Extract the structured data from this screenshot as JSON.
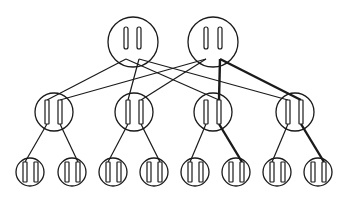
{
  "diagram": {
    "type": "hierarchical-tree",
    "colors": {
      "stroke": "#1a1a1a",
      "background": "#ffffff"
    },
    "levels": [
      {
        "name": "top",
        "radius": 25,
        "nodes": [
          {
            "id": "T1",
            "cx": 133,
            "cy": 42,
            "rods": [
              126,
              139
            ]
          },
          {
            "id": "T2",
            "cx": 213,
            "cy": 42,
            "rods": [
              206,
              220
            ]
          }
        ]
      },
      {
        "name": "middle",
        "radius": 19,
        "nodes": [
          {
            "id": "M1",
            "cx": 54,
            "cy": 112,
            "rods": [
              47,
              60
            ]
          },
          {
            "id": "M2",
            "cx": 134,
            "cy": 112,
            "rods": [
              128,
              141
            ]
          },
          {
            "id": "M3",
            "cx": 213,
            "cy": 112,
            "rods": [
              206,
              219
            ]
          },
          {
            "id": "M4",
            "cx": 295,
            "cy": 112,
            "rods": [
              288,
              301
            ]
          }
        ]
      },
      {
        "name": "bottom",
        "radius": 14,
        "nodes": [
          {
            "id": "B1",
            "cx": 30,
            "cy": 172,
            "rods": [
              25,
              36
            ]
          },
          {
            "id": "B2",
            "cx": 72,
            "cy": 172,
            "rods": [
              67,
              78
            ]
          },
          {
            "id": "B3",
            "cx": 113,
            "cy": 172,
            "rods": [
              108,
              119
            ]
          },
          {
            "id": "B4",
            "cx": 154,
            "cy": 172,
            "rods": [
              149,
              160
            ]
          },
          {
            "id": "B5",
            "cx": 195,
            "cy": 172,
            "rods": [
              190,
              201
            ]
          },
          {
            "id": "B6",
            "cx": 236,
            "cy": 172,
            "rods": [
              231,
              242
            ]
          },
          {
            "id": "B7",
            "cx": 277,
            "cy": 172,
            "rods": [
              272,
              283
            ]
          },
          {
            "id": "B8",
            "cx": 318,
            "cy": 172,
            "rods": [
              313,
              324
            ]
          }
        ]
      }
    ],
    "edges": [
      {
        "from": [
          126,
          59
        ],
        "to": [
          47,
          100
        ],
        "bold": false
      },
      {
        "from": [
          126,
          59
        ],
        "to": [
          219,
          100
        ],
        "bold": false
      },
      {
        "from": [
          139,
          59
        ],
        "to": [
          128,
          100
        ],
        "bold": false
      },
      {
        "from": [
          139,
          59
        ],
        "to": [
          288,
          100
        ],
        "bold": false
      },
      {
        "from": [
          206,
          59
        ],
        "to": [
          60,
          100
        ],
        "bold": false
      },
      {
        "from": [
          206,
          59
        ],
        "to": [
          141,
          100
        ],
        "bold": false
      },
      {
        "from": [
          220,
          59
        ],
        "to": [
          219,
          100
        ],
        "bold": true
      },
      {
        "from": [
          220,
          59
        ],
        "to": [
          301,
          100
        ],
        "bold": true
      },
      {
        "from": [
          47,
          124
        ],
        "to": [
          25,
          162
        ],
        "bold": false
      },
      {
        "from": [
          60,
          124
        ],
        "to": [
          78,
          162
        ],
        "bold": false
      },
      {
        "from": [
          128,
          124
        ],
        "to": [
          108,
          162
        ],
        "bold": false
      },
      {
        "from": [
          141,
          124
        ],
        "to": [
          160,
          162
        ],
        "bold": false
      },
      {
        "from": [
          206,
          124
        ],
        "to": [
          190,
          162
        ],
        "bold": false
      },
      {
        "from": [
          219,
          124
        ],
        "to": [
          242,
          162
        ],
        "bold": true
      },
      {
        "from": [
          288,
          124
        ],
        "to": [
          272,
          162
        ],
        "bold": false
      },
      {
        "from": [
          301,
          124
        ],
        "to": [
          324,
          162
        ],
        "bold": true
      }
    ]
  }
}
